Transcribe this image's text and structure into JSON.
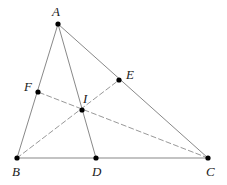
{
  "figure": {
    "width": 227,
    "height": 185,
    "background_color": "#ffffff",
    "solid_line_color": "#7a7a7a",
    "base_line_color": "#b0b0b0",
    "dashed_line_color": "#8c8c8c",
    "point_color": "#000000",
    "label_color": "#1a1a1a",
    "point_radius": 2.6,
    "dash_pattern": "5,3"
  },
  "points": {
    "A": {
      "name": "A",
      "label": "A",
      "x": 58,
      "y": 24,
      "label_x": 52,
      "label_y": 5
    },
    "B": {
      "name": "B",
      "label": "B",
      "x": 17,
      "y": 158,
      "label_x": 12,
      "label_y": 165
    },
    "C": {
      "name": "C",
      "label": "C",
      "x": 208,
      "y": 158,
      "label_x": 206,
      "label_y": 165
    },
    "D": {
      "name": "D",
      "label": "D",
      "x": 96,
      "y": 158,
      "label_x": 92,
      "label_y": 165
    },
    "E": {
      "name": "E",
      "label": "E",
      "x": 119,
      "y": 80,
      "label_x": 126,
      "label_y": 68
    },
    "F": {
      "name": "F",
      "label": "F",
      "x": 38,
      "y": 92,
      "label_x": 24,
      "label_y": 80
    },
    "I": {
      "name": "I",
      "label": "I",
      "x": 82,
      "y": 110,
      "label_x": 83,
      "label_y": 92
    }
  },
  "segments": {
    "solid": [
      {
        "name": "side-AB",
        "from": "A",
        "to": "B",
        "style": "solid"
      },
      {
        "name": "side-AC",
        "from": "A",
        "to": "C",
        "style": "solid"
      },
      {
        "name": "cevian-AD",
        "from": "A",
        "to": "D",
        "style": "solid"
      }
    ],
    "base": [
      {
        "name": "side-BC",
        "from": "B",
        "to": "C",
        "style": "solid"
      }
    ],
    "dashed": [
      {
        "name": "cevian-BE",
        "from": "B",
        "to": "E",
        "style": "dashed"
      },
      {
        "name": "cevian-CF",
        "from": "C",
        "to": "F",
        "style": "dashed"
      }
    ]
  },
  "point_order": [
    "A",
    "B",
    "C",
    "D",
    "E",
    "F",
    "I"
  ]
}
